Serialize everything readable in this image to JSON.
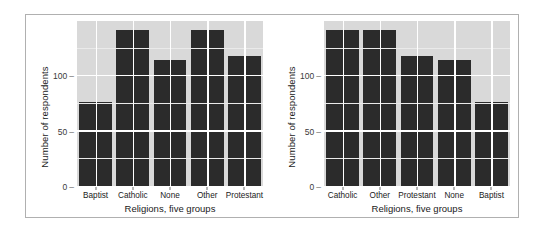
{
  "figure": {
    "background_color": "#ffffff",
    "frame_color": "#b0b0b0",
    "panel_color": "#d9d9d9",
    "bar_color": "#2b2b2b",
    "gridline_color": "#ffffff"
  },
  "chart_data": [
    {
      "type": "bar",
      "title": "",
      "subtitle": "",
      "xlabel": "Religions, five groups",
      "ylabel": "Number of respondents",
      "categories": [
        "Baptist",
        "Catholic",
        "None",
        "Other",
        "Protestant"
      ],
      "values": [
        77,
        142,
        115,
        142,
        118
      ],
      "ylim": [
        0,
        150
      ],
      "yticks": [
        0,
        50,
        100
      ],
      "ytick_labels": [
        "0",
        "50",
        "100"
      ],
      "minor_gridlines": [
        25,
        75,
        125
      ],
      "grid": true,
      "legend": "none",
      "ordering": "alphabetical"
    },
    {
      "type": "bar",
      "title": "",
      "subtitle": "",
      "xlabel": "Religions, five groups",
      "ylabel": "Number of respondents",
      "categories": [
        "Catholic",
        "Other",
        "Protestant",
        "None",
        "Baptist"
      ],
      "values": [
        142,
        142,
        118,
        115,
        77
      ],
      "ylim": [
        0,
        150
      ],
      "yticks": [
        0,
        50,
        100
      ],
      "ytick_labels": [
        "0",
        "50",
        "100"
      ],
      "minor_gridlines": [
        25,
        75,
        125
      ],
      "grid": true,
      "legend": "none",
      "ordering": "descending-by-frequency"
    }
  ]
}
